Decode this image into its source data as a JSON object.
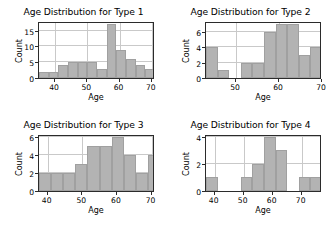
{
  "figure": {
    "background": "#ffffff",
    "bar_color": "#b3b3b3",
    "grid_color": "#c9c9c9",
    "axis_color": "#2b2b2b",
    "layout": "2x2"
  },
  "chart_data": [
    {
      "type": "bar",
      "title": "Age Distribution for Type 1",
      "xlabel": "Age",
      "ylabel": "Count",
      "xlim": [
        35,
        71
      ],
      "ylim": [
        0,
        18
      ],
      "xticks": [
        40,
        50,
        60,
        70
      ],
      "yticks": [
        0,
        5,
        10,
        15
      ],
      "grid": true,
      "bin_edges": [
        35,
        38,
        41,
        44,
        47,
        50,
        53,
        56,
        59,
        62,
        65,
        68,
        71
      ],
      "values": [
        2,
        2,
        4,
        5,
        5,
        5,
        3,
        17,
        9,
        6,
        4,
        3
      ],
      "categories": [
        "35-38",
        "38-41",
        "41-44",
        "44-47",
        "47-50",
        "50-53",
        "53-56",
        "56-59",
        "59-62",
        "62-65",
        "65-68",
        "68-71"
      ]
    },
    {
      "type": "bar",
      "title": "Age Distribution for Type 2",
      "xlabel": "Age",
      "ylabel": "Count",
      "xlim": [
        43,
        70
      ],
      "ylim": [
        0,
        7.4
      ],
      "xticks": [
        50,
        60,
        70
      ],
      "yticks": [
        0,
        2,
        4,
        6
      ],
      "grid": true,
      "bin_edges": [
        43,
        45.7,
        48.4,
        51.1,
        53.8,
        56.5,
        59.2,
        61.9,
        64.6,
        67.3,
        70
      ],
      "values": [
        4,
        1,
        0,
        2,
        2,
        6,
        7,
        7,
        3,
        4
      ],
      "categories": [
        "43-45.7",
        "45.7-48.4",
        "48.4-51.1",
        "51.1-53.8",
        "53.8-56.5",
        "56.5-59.2",
        "59.2-61.9",
        "61.9-64.6",
        "64.6-67.3",
        "67.3-70"
      ]
    },
    {
      "type": "bar",
      "title": "Age Distribution for Type 3",
      "xlabel": "Age",
      "ylabel": "Count",
      "xlim": [
        37.5,
        71
      ],
      "ylim": [
        0,
        6.3
      ],
      "xticks": [
        40,
        50,
        60,
        70
      ],
      "yticks": [
        0,
        2,
        4,
        6
      ],
      "grid": true,
      "bin_edges": [
        37.5,
        41,
        44.5,
        48,
        51.5,
        55,
        58.5,
        62,
        65.5,
        69,
        71
      ],
      "values": [
        2,
        2,
        2,
        3,
        5,
        5,
        6,
        4,
        2,
        4
      ],
      "categories": [
        "37.5-41",
        "41-44.5",
        "44.5-48",
        "48-51.5",
        "51.5-55",
        "55-58.5",
        "58.5-62",
        "62-65.5",
        "65.5-69",
        "69-71"
      ]
    },
    {
      "type": "bar",
      "title": "Age Distribution for Type 4",
      "xlabel": "Age",
      "ylabel": "Count",
      "xlim": [
        37,
        77
      ],
      "ylim": [
        0,
        4.2
      ],
      "xticks": [
        40,
        50,
        60,
        70
      ],
      "yticks": [
        0,
        2,
        4
      ],
      "grid": true,
      "bin_edges": [
        37,
        41,
        45,
        49,
        53,
        57,
        61,
        65,
        69,
        73,
        77
      ],
      "values": [
        1,
        0,
        0,
        1,
        2,
        4,
        3,
        0,
        1,
        1
      ],
      "categories": [
        "37-41",
        "41-45",
        "45-49",
        "49-53",
        "53-57",
        "57-61",
        "61-65",
        "65-69",
        "69-73",
        "73-77"
      ]
    }
  ]
}
